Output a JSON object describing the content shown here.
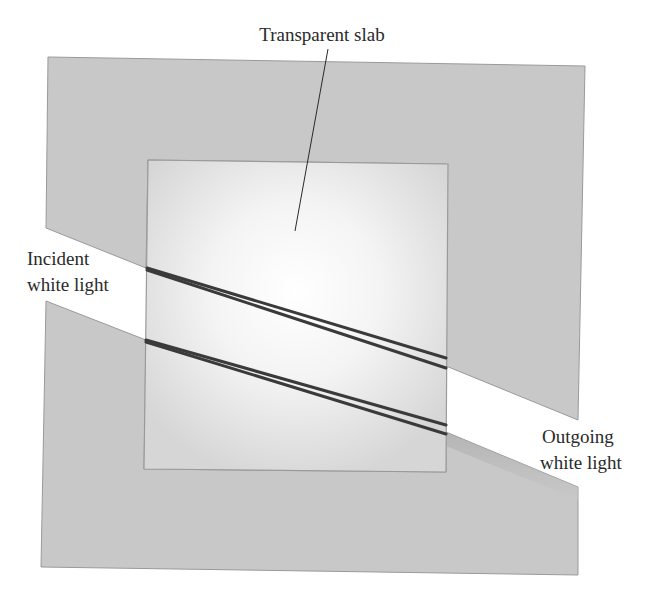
{
  "diagram": {
    "labels": {
      "slab": "Transparent slab",
      "incident_line1": "Incident",
      "incident_line2": "white light",
      "outgoing_line1": "Outgoing",
      "outgoing_line2": "white light"
    },
    "colors": {
      "background_panel": "#c8c8c8",
      "panel_border": "#9a9a9a",
      "slab_center": "#ffffff",
      "slab_edge": "#d8d8d8",
      "ray": "#3a3a3a",
      "text": "#2a2a2a"
    }
  }
}
